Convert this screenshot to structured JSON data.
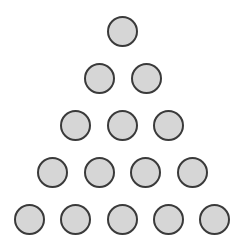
{
  "diagram": {
    "title": "",
    "shape": "triangular arrangement of circles",
    "rows": [
      {
        "count": 1,
        "y": 31,
        "xs": [
          122
        ]
      },
      {
        "count": 2,
        "y": 78,
        "xs": [
          99,
          146
        ]
      },
      {
        "count": 3,
        "y": 125,
        "xs": [
          75,
          122,
          168
        ]
      },
      {
        "count": 4,
        "y": 172,
        "xs": [
          52,
          99,
          145,
          192
        ]
      },
      {
        "count": 5,
        "y": 219,
        "xs": [
          29,
          75,
          122,
          168,
          214
        ]
      }
    ],
    "total_circles": 15,
    "circle_diameter": 31,
    "colors": {
      "fill": "#d6d6d6",
      "stroke": "#3a3a3a",
      "background": "#ffffff"
    }
  }
}
